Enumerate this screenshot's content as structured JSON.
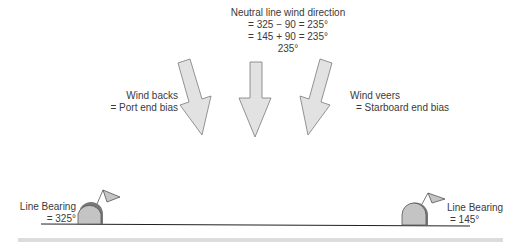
{
  "title": {
    "line1": "Neutral line wind direction",
    "line2": "= 325 − 90 = 235°",
    "line3": "= 145 + 90 = 235°",
    "line4": "235°"
  },
  "left_label": {
    "line1": "Wind backs",
    "line2": "= Port end bias"
  },
  "right_label": {
    "line1": "Wind veers",
    "line2": "= Starboard end bias"
  },
  "port_mark": {
    "line1": "Line Bearing",
    "line2": "= 325°"
  },
  "starboard_mark": {
    "line1": "Line Bearing",
    "line2": "= 145°"
  },
  "colors": {
    "arrow_fill": "#e2e2e2",
    "arrow_stroke": "#7a7a7a",
    "buoy_fill": "#c4c4c4",
    "line": "#222222"
  }
}
